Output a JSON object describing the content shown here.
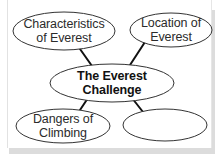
{
  "diagram": {
    "type": "concept-map",
    "colors": {
      "stroke": "#333333",
      "connector": "#111111",
      "text": "#2b2b2b",
      "background": "#ffffff",
      "shadow": "#dcdcdc"
    },
    "central": {
      "id": "central",
      "line1": "The Everest",
      "line2": "Challenge",
      "cx": 112,
      "cy": 83,
      "rx": 62,
      "ry": 19
    },
    "nodes": [
      {
        "id": "top-left",
        "line1": "Characteristics",
        "line2": "of Everest",
        "cx": 64,
        "cy": 31,
        "rx": 51,
        "ry": 19
      },
      {
        "id": "top-right",
        "line1": "Location of",
        "line2": "Everest",
        "cx": 171,
        "cy": 30,
        "rx": 41,
        "ry": 17
      },
      {
        "id": "bottom-left",
        "line1": "Dangers of",
        "line2": "Climbing",
        "cx": 63,
        "cy": 126,
        "rx": 47,
        "ry": 17
      },
      {
        "id": "bottom-right",
        "line1": "",
        "line2": "",
        "cx": 165,
        "cy": 125,
        "rx": 42,
        "ry": 16
      }
    ],
    "edges": [
      {
        "from": "central",
        "to": "top-left",
        "x1": 80,
        "y1": 49,
        "x2": 92,
        "y2": 66
      },
      {
        "from": "central",
        "to": "top-right",
        "x1": 145,
        "y1": 42,
        "x2": 130,
        "y2": 65
      },
      {
        "from": "central",
        "to": "bottom-left",
        "x1": 88,
        "y1": 98,
        "x2": 80,
        "y2": 110
      },
      {
        "from": "central",
        "to": "bottom-right",
        "x1": 132,
        "y1": 98,
        "x2": 143,
        "y2": 112
      }
    ]
  }
}
